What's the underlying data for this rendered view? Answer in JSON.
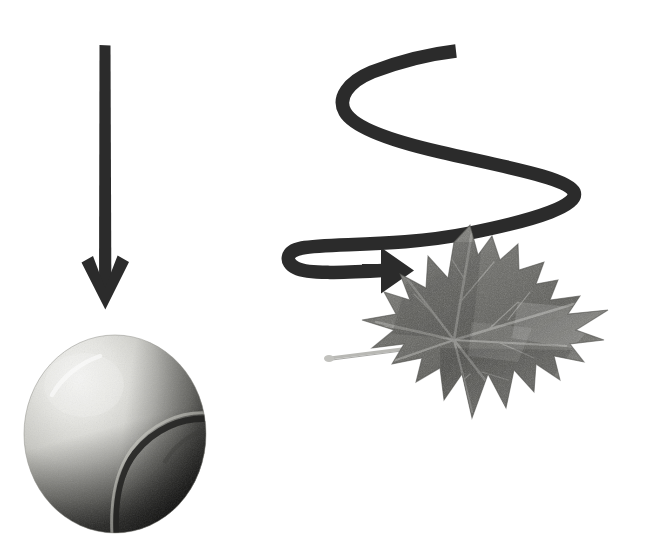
{
  "scene": {
    "title": "Falling object trajectories",
    "width": 663,
    "height": 554,
    "background_color": "#ffffff",
    "description": "A straight vertical arrow pointing down at a tennis ball, and a winding spiral arrow pointing at a maple leaf."
  },
  "palette": {
    "arrow_dark": "#2b2b2b",
    "arrow_dark_edge": "#1e1e1e",
    "ball_highlight": "#f2f2f0",
    "ball_light": "#dcdcd8",
    "ball_mid": "#9a9a96",
    "ball_dark": "#1c1c1c",
    "ball_seam": "#3a3a38",
    "leaf_light": "#a8a8a4",
    "leaf_mid": "#6a6a66",
    "leaf_dark": "#3c3c3a",
    "leaf_vein": "#8e8e8a",
    "stem_gray": "#b4b4b0"
  },
  "elements": {
    "straight_arrow": {
      "name": "straight-down-arrow",
      "direction": "down",
      "shaft_x": 104,
      "shaft_top_y": 45,
      "shaft_bottom_y": 300,
      "shaft_width": 11,
      "head_tip_x": 105,
      "head_tip_y": 308,
      "head_half_width": 24,
      "color": "#2b2b2b",
      "meaning": "ball falls straight down"
    },
    "curved_arrow": {
      "name": "winding-spiral-arrow",
      "direction": "right",
      "stroke_width": 13,
      "start_x": 456,
      "start_y": 50,
      "end_x": 400,
      "end_y": 268,
      "turn_points": [
        {
          "x": 347,
          "y": 100
        },
        {
          "x": 576,
          "y": 163
        },
        {
          "x": 294,
          "y": 254
        }
      ],
      "color": "#2b2b2b",
      "meaning": "leaf flutters and spirals down"
    },
    "tennis_ball": {
      "name": "tennis-ball",
      "left": 22,
      "top": 333,
      "width": 186,
      "height": 202,
      "seam_label": "curved seam",
      "shading": "grayscale, lit from upper-left"
    },
    "maple_leaf": {
      "name": "maple-leaf",
      "left": 322,
      "top": 222,
      "width": 290,
      "height": 235,
      "lobes": 5,
      "stem_from": {
        "x": 328,
        "y": 356
      },
      "stem_to": {
        "x": 456,
        "y": 341
      },
      "shading": "grayscale, textured with veins"
    }
  },
  "labels": {
    "straight_arrow_alt": "Downward arrow",
    "curved_arrow_alt": "Spiralling arrow",
    "ball_alt": "Tennis ball",
    "leaf_alt": "Maple leaf"
  }
}
